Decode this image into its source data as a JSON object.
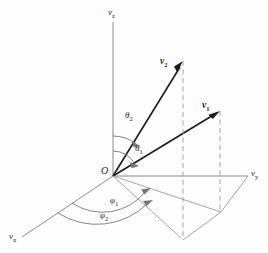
{
  "figure": {
    "background_color": "#fdfdfd",
    "axis_color": "#8a8a8a",
    "vector_color": "#1c1c1c",
    "dashed_color": "#9b9b9b",
    "arc_color": "#777777"
  },
  "axes": [
    {
      "id": "z",
      "label_main": "v",
      "label_sub": "z",
      "name": "vertical-axis"
    },
    {
      "id": "y",
      "label_main": "v",
      "label_sub": "y",
      "name": "right-axis"
    },
    {
      "id": "x",
      "label_main": "v",
      "label_sub": "x",
      "name": "lower-left-axis"
    }
  ],
  "origin": {
    "label": "O"
  },
  "vectors": [
    {
      "id": "v1",
      "label_main": "v",
      "label_sub": "1"
    },
    {
      "id": "v2",
      "label_main": "v",
      "label_sub": "2"
    }
  ],
  "polar_angles": [
    {
      "id": "theta1",
      "label_main": "θ",
      "label_sub": "1"
    },
    {
      "id": "theta2",
      "label_main": "θ",
      "label_sub": "2"
    }
  ],
  "azimuthal_angles": [
    {
      "id": "phi1",
      "label_main": "φ",
      "label_sub": "1"
    },
    {
      "id": "phi2",
      "label_main": "φ",
      "label_sub": "2"
    }
  ]
}
